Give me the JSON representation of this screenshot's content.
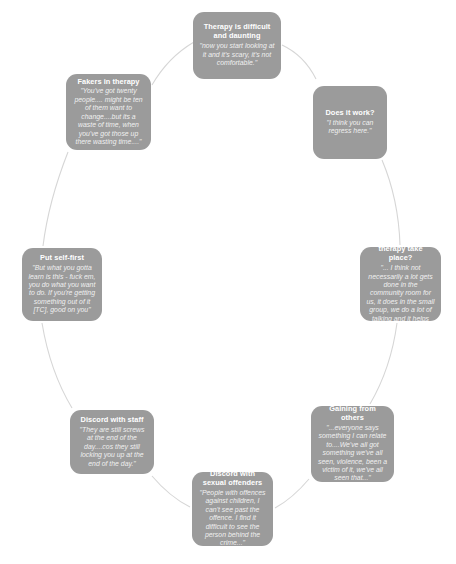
{
  "diagram": {
    "type": "cycle",
    "layout": "circular",
    "node_color": "#9b9b9b",
    "text_color": "#ffffff",
    "connector_color": "#d4d4d4",
    "background_color": "#ffffff",
    "nodes": [
      {
        "id": "therapy-difficult",
        "title": "Therapy is difficult and daunting",
        "quote": "\"now you start looking at it and it's scary, it's not comfortable.\""
      },
      {
        "id": "does-it-work",
        "title": "Does it work?",
        "quote": "\"I think you can regress here.\""
      },
      {
        "id": "where-therapy",
        "title": "Where does therapy take place?",
        "quote": "\"... I think not necessarily a lot gets done in the community room for us, it does in the small group, we do a lot of talking and it helps you.\""
      },
      {
        "id": "gaining-others",
        "title": "Gaining from others",
        "quote": "\"...everyone says something I can relate to....We've all got something we've all seen, violence, been a victim of it, we've all seen that...\""
      },
      {
        "id": "discord-sexual",
        "title": "Discord with sexual offenders",
        "quote": "\"People with offences against children, I can't see past the offence. I find it difficult to see the person behind the crime...\""
      },
      {
        "id": "discord-staff",
        "title": "Discord with staff",
        "quote": "\"They are still screws at the end of the day....cos they still locking you up at the end of the day.\""
      },
      {
        "id": "put-self-first",
        "title": "Put self-first",
        "quote": "\"But what you gotta learn is this - fuck em, you do what you want to do. If you're getting something out of it [TC], good on you\""
      },
      {
        "id": "fakers-therapy",
        "title": "Fakers in therapy",
        "quote": "\"You've got twenty people.... might be ten of them want to change....but its a waste of time, when you've got those up there wasting time....\""
      }
    ]
  }
}
